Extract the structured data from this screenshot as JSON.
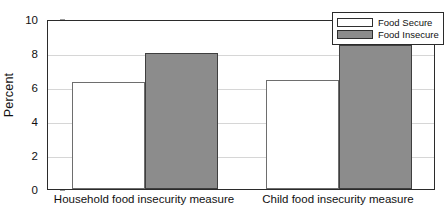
{
  "chart_data": {
    "type": "bar",
    "title": "",
    "xlabel": "",
    "ylabel": "Percent",
    "ylim": [
      0,
      10
    ],
    "yticks": [
      0,
      2,
      4,
      6,
      8,
      10
    ],
    "ytick_labels": [
      "0",
      "2",
      "4",
      "6",
      "8",
      "10"
    ],
    "grid": true,
    "legend_position": "top-right",
    "categories": [
      "Household food insecurity measure",
      "Child food insecurity measure"
    ],
    "series": [
      {
        "name": "Food Secure",
        "color": "#ffffff",
        "values": [
          6.3,
          6.4
        ]
      },
      {
        "name": "Food Insecure",
        "color": "#8c8c8c",
        "values": [
          8.0,
          8.5
        ]
      }
    ]
  },
  "legend": {
    "items": [
      {
        "label": "Food Secure",
        "swatch": "secure"
      },
      {
        "label": "Food Insecure",
        "swatch": "insecure"
      }
    ]
  }
}
